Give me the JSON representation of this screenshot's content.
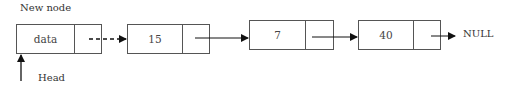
{
  "diagram": {
    "title_label": "New node",
    "head_label": "Head",
    "null_label": "NULL",
    "nodes": [
      {
        "data": "data",
        "is_new": true
      },
      {
        "data": "15"
      },
      {
        "data": "7"
      },
      {
        "data": "40"
      }
    ],
    "links": [
      {
        "from": 0,
        "to": 1,
        "style": "dashed"
      },
      {
        "from": 1,
        "to": 2,
        "style": "solid"
      },
      {
        "from": 2,
        "to": 3,
        "style": "solid"
      },
      {
        "from": 3,
        "to": "NULL",
        "style": "solid"
      }
    ],
    "colors": {
      "stroke": "#555555",
      "arrow": "#111111",
      "text": "#333333"
    }
  }
}
